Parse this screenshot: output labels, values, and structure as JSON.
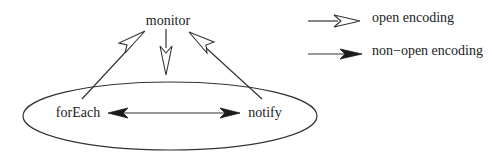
{
  "diagram": {
    "nodes": [
      {
        "id": "monitor",
        "label": "monitor"
      },
      {
        "id": "forEach",
        "label": "forEach"
      },
      {
        "id": "notify",
        "label": "notify"
      }
    ],
    "edges": [
      {
        "from": "forEach",
        "to": "monitor",
        "type": "open encoding"
      },
      {
        "from": "monitor",
        "to": "group",
        "type": "open encoding"
      },
      {
        "from": "notify",
        "to": "monitor",
        "type": "open encoding"
      },
      {
        "from": "forEach",
        "to": "notify",
        "type": "non-open encoding",
        "bidirectional": true
      }
    ],
    "group": {
      "members": [
        "forEach",
        "notify"
      ],
      "shape": "ellipse"
    }
  },
  "legend": {
    "items": [
      {
        "label": "open encoding",
        "arrow": "open"
      },
      {
        "label": "non−open encoding",
        "arrow": "filled"
      }
    ]
  },
  "colors": {
    "stroke": "#333333",
    "text": "#222222",
    "background": "#ffffff"
  }
}
